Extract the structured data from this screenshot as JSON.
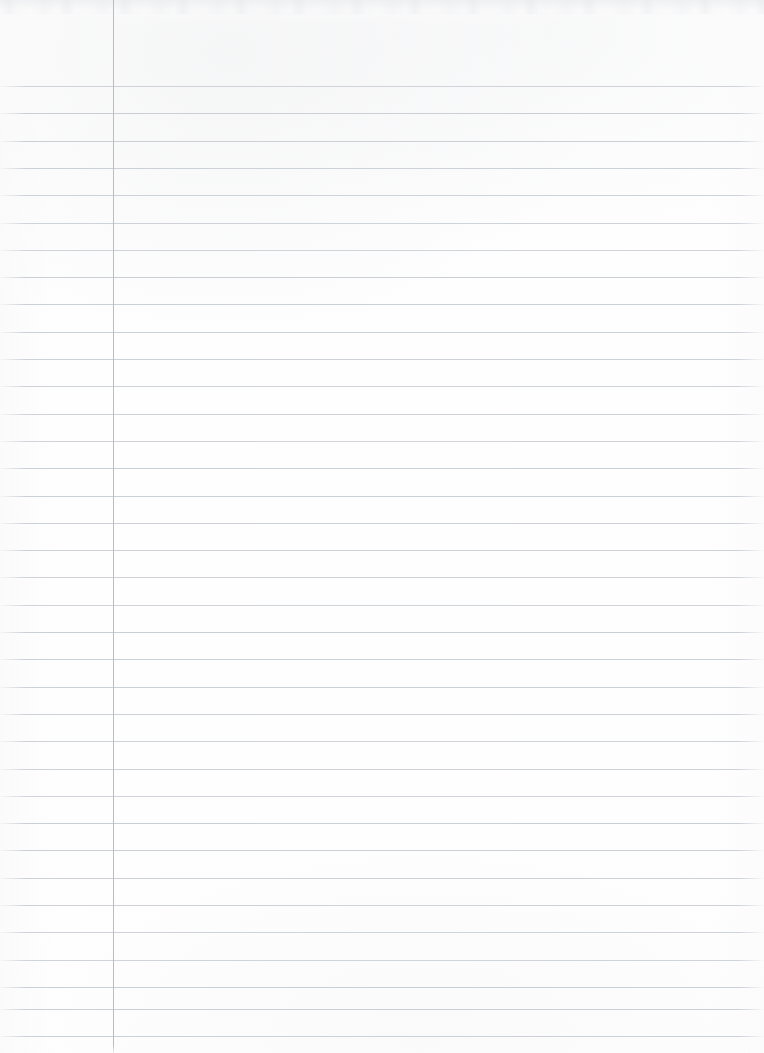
{
  "document": {
    "title": "Blank Ruled Notebook Paper",
    "description": "Scanned blank sheet of lined notebook paper",
    "page_width": 764,
    "page_height": 1053,
    "content_text": "",
    "has_handwriting": false
  },
  "paper": {
    "background_color": "#fefefe",
    "rule_color": "#c7ccd3",
    "margin_rule_color": "#b6b9be",
    "rule_thickness_px": 1,
    "rule_spacing_px": 27.3,
    "first_rule_y_px": 86,
    "rule_count": 36,
    "rule_left_x_px": 0,
    "rule_right_x_px": 764,
    "margin_rule_x_px": 113,
    "margin_rule_top_y_px": 0,
    "margin_rule_bottom_y_px": 1053,
    "header_blank_height_px": 86
  },
  "rules_y": [
    86,
    113.3,
    140.6,
    167.9,
    195.2,
    222.5,
    249.8,
    277.1,
    304.4,
    331.7,
    359,
    386.3,
    413.6,
    440.9,
    468.2,
    495.5,
    522.8,
    550.1,
    577.4,
    604.7,
    632,
    659.3,
    686.6,
    713.9,
    741.2,
    768.5,
    795.8,
    823.1,
    850.4,
    877.7,
    905,
    932.3,
    959.6,
    986.9,
    1008.5,
    1035.8
  ],
  "regions": {
    "left_margin_label": "left margin column",
    "writing_area_label": "writing area",
    "top_header_label": "blank header area"
  }
}
